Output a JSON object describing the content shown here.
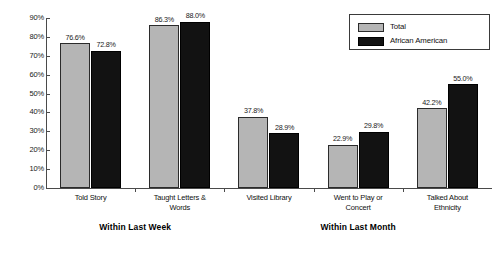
{
  "chart_data": {
    "type": "bar",
    "title": "",
    "xlabel": "",
    "ylabel": "",
    "ylim": [
      0,
      90
    ],
    "grid": false,
    "legend_position": "top-right",
    "categories": [
      "Told Story",
      "Taught Letters & Words",
      "Visited Library",
      "Went to Play or Concert",
      "Talked About Ethnicity"
    ],
    "category_lines": [
      [
        "Told Story"
      ],
      [
        "Taught Letters &",
        "Words"
      ],
      [
        "Visited Library"
      ],
      [
        "Went to Play or",
        "Concert"
      ],
      [
        "Talked About",
        "Ethnicity"
      ]
    ],
    "series": [
      {
        "name": "Total",
        "color": "#b5b5b5",
        "values": [
          76.6,
          86.3,
          37.8,
          22.9,
          42.2
        ],
        "labels": [
          "76.6%",
          "86.3%",
          "37.8%",
          "22.9%",
          "42.2%"
        ]
      },
      {
        "name": "African American",
        "color": "#121212",
        "values": [
          72.8,
          88.0,
          28.9,
          29.8,
          55.0
        ],
        "labels": [
          "72.8%",
          "88.0%",
          "28.9%",
          "29.8%",
          "55.0%"
        ]
      }
    ],
    "y_ticks": [
      "0%",
      "10%",
      "20%",
      "30%",
      "40%",
      "50%",
      "60%",
      "70%",
      "80%",
      "90%"
    ],
    "y_tick_values": [
      0,
      10,
      20,
      30,
      40,
      50,
      60,
      70,
      80,
      90
    ],
    "group_headers": [
      {
        "label": "Within Last Week",
        "categories": [
          "Told Story",
          "Taught Letters & Words"
        ]
      },
      {
        "label": "Within Last Month",
        "categories": [
          "Visited Library",
          "Went to Play or Concert",
          "Talked About Ethnicity"
        ]
      }
    ]
  },
  "legend": {
    "items": [
      {
        "label": "Total",
        "swatch": "total"
      },
      {
        "label": "African American",
        "swatch": "aa"
      }
    ]
  }
}
